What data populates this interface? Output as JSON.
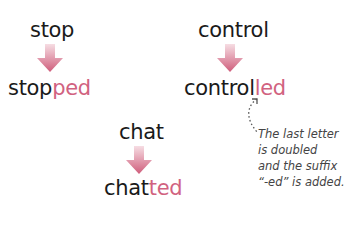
{
  "examples": [
    {
      "base": "stop",
      "stem": "stop",
      "suffix": "ped"
    },
    {
      "base": "control",
      "stem": "control",
      "suffix": "led"
    },
    {
      "base": "chat",
      "stem": "chat",
      "suffix": "ted"
    }
  ],
  "note": {
    "line1": "The last letter",
    "line2": "is doubled",
    "line3": "and the suffix",
    "line4": "“-ed” is added."
  },
  "colors": {
    "suffix": "#d1627f",
    "arrow_top": "#f4d3db",
    "arrow_bottom": "#d1627f"
  }
}
